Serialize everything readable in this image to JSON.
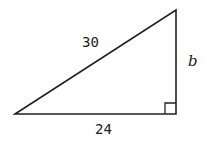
{
  "diagram": {
    "type": "right-triangle",
    "hypotenuse_label": "30",
    "vertical_leg_label": "b",
    "base_label": "24",
    "right_angle_marker": true,
    "stroke_color": "#222222"
  }
}
